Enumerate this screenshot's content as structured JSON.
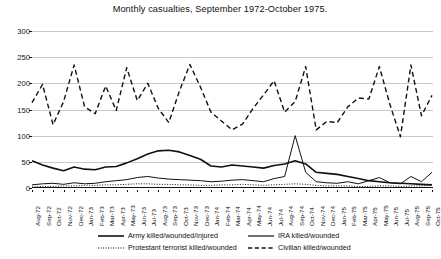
{
  "chart_data": {
    "type": "line",
    "title": "Monthly casualties, September 1972-October 1975.",
    "xlabel": "",
    "ylabel": "",
    "ylim": [
      0,
      300
    ],
    "yticks": [
      0,
      50,
      100,
      150,
      200,
      250,
      300
    ],
    "grid": true,
    "legend_position": "bottom",
    "categories": [
      "Aug-72",
      "Sep-72",
      "Oct-72",
      "Nov-72",
      "Dec-72",
      "Jan-73",
      "Feb-73",
      "Mar-73",
      "Apr-73",
      "May-73",
      "Jun-73",
      "Jul-73",
      "Aug-73",
      "Sep-73",
      "Oct-73",
      "Nov-73",
      "Dec-73",
      "Jan-74",
      "Feb-74",
      "Mar-74",
      "Apr-74",
      "May-74",
      "Jun-74",
      "Jul-74",
      "Aug-74",
      "Sep-74",
      "Oct-74",
      "Nov-74",
      "Dec-74",
      "Jan-75",
      "Feb-75",
      "Mar-75",
      "Apr-75",
      "May-75",
      "Jun-75",
      "Jul-75",
      "Aug-75",
      "Sep-75",
      "Oct-75"
    ],
    "series": [
      {
        "name": "Army killed/wounded/injured",
        "style": "solid",
        "width": 1.6,
        "color": "#111111",
        "values": [
          52,
          44,
          38,
          33,
          40,
          36,
          35,
          40,
          41,
          48,
          56,
          65,
          71,
          72,
          69,
          62,
          55,
          42,
          40,
          44,
          42,
          40,
          38,
          43,
          46,
          52,
          46,
          30,
          28,
          26,
          22,
          18,
          14,
          12,
          10,
          9,
          8,
          7,
          6
        ]
      },
      {
        "name": "IRA killed/wounded",
        "style": "solid",
        "width": 1.0,
        "color": "#111111",
        "values": [
          6,
          8,
          9,
          7,
          10,
          8,
          9,
          12,
          14,
          16,
          20,
          22,
          19,
          17,
          16,
          15,
          14,
          12,
          13,
          15,
          16,
          14,
          12,
          18,
          22,
          100,
          30,
          12,
          10,
          9,
          12,
          8,
          14,
          20,
          10,
          8,
          22,
          12,
          30
        ]
      },
      {
        "name": "Protestant terrorist killed/wounded",
        "style": "dotted",
        "width": 1.0,
        "color": "#111111",
        "values": [
          2,
          3,
          3,
          4,
          4,
          5,
          5,
          6,
          6,
          7,
          8,
          8,
          7,
          7,
          6,
          6,
          5,
          5,
          6,
          6,
          7,
          6,
          5,
          6,
          7,
          8,
          7,
          5,
          4,
          4,
          4,
          3,
          3,
          4,
          4,
          3,
          4,
          4,
          5
        ]
      },
      {
        "name": "Civilian killed/wounded",
        "style": "dashed",
        "width": 1.4,
        "color": "#111111",
        "values": [
          163,
          198,
          121,
          165,
          235,
          155,
          142,
          195,
          148,
          230,
          167,
          200,
          152,
          125,
          185,
          236,
          193,
          145,
          128,
          111,
          122,
          152,
          178,
          205,
          145,
          165,
          232,
          111,
          127,
          125,
          155,
          172,
          170,
          232,
          160,
          98,
          235,
          138,
          177
        ]
      }
    ]
  },
  "legend": {
    "items": [
      {
        "label": "Army killed/wounded/injured",
        "style": "solid-thick"
      },
      {
        "label": "IRA killed/wounded",
        "style": "solid-thin"
      },
      {
        "label": "Protestant terrorist killed/wounded",
        "style": "dotted"
      },
      {
        "label": "Civilian killed/wounded",
        "style": "dashed"
      }
    ]
  }
}
